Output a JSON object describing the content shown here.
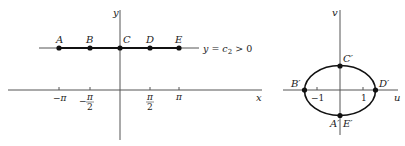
{
  "left_plot": {
    "axes": {
      "x_label": "x",
      "y_label": "y"
    },
    "line_label": {
      "lhs": "y = c",
      "sub": "2",
      "rhs": " > 0"
    },
    "points": [
      {
        "label": "A",
        "x": 59
      },
      {
        "label": "B",
        "x": 90
      },
      {
        "label": "C",
        "x": 120
      },
      {
        "label": "D",
        "x": 150
      },
      {
        "label": "E",
        "x": 179
      }
    ],
    "ticks": {
      "neg_pi": "−π",
      "neg_half_pi_minus": "−",
      "pi_num": "π",
      "half_den": "2",
      "pi": "π"
    }
  },
  "right_plot": {
    "axes": {
      "x_label": "u",
      "y_label": "v"
    },
    "points": {
      "B": "B′",
      "C": "C′",
      "D": "D′",
      "AE_a": "A′",
      "AE_e": "E′"
    },
    "ticks": {
      "neg_one": "−1",
      "one": "1"
    }
  },
  "colors": {
    "ink": "#222222",
    "axis": "#555555",
    "background": "#ffffff"
  }
}
